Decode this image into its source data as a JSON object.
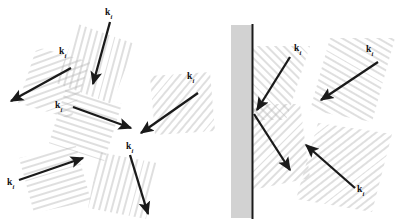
{
  "figure": {
    "background_color": "#ffffff",
    "hatch_color": "#b3b3b3",
    "arrow_color": "#1a1a1a",
    "substrate_fill": "#d2d2d2",
    "substrate_edge": "#1a1a1a",
    "label_symbol": "k",
    "label_subscript": "i"
  },
  "panels": [
    {
      "name": "left-panel",
      "description": "six incident wave-vector arrows with hatched wavefront patches radiating about a center",
      "arrows": [
        {
          "id": "top",
          "label": "k",
          "sub": "i",
          "x1": 110,
          "y1": 22,
          "x2": 93,
          "y2": 84,
          "hatch_angle_deg": 15,
          "label_x": 105,
          "label_y": 8
        },
        {
          "id": "upper-left",
          "label": "k",
          "sub": "i",
          "x1": 71,
          "y1": 68,
          "x2": 11,
          "y2": 101,
          "hatch_angle_deg": 70,
          "label_x": 59,
          "label_y": 47
        },
        {
          "id": "center-right",
          "label": "k",
          "sub": "i",
          "x1": 73,
          "y1": 107,
          "x2": 131,
          "y2": 128,
          "hatch_angle_deg": 108,
          "label_x": 55,
          "label_y": 110
        },
        {
          "id": "right",
          "label": "k",
          "sub": "i",
          "x1": 198,
          "y1": 93,
          "x2": 141,
          "y2": 133,
          "hatch_angle_deg": 40,
          "label_x": 187,
          "label_y": 78
        },
        {
          "id": "lower-left",
          "label": "k",
          "sub": "i",
          "x1": 19,
          "y1": 180,
          "x2": 83,
          "y2": 158,
          "hatch_angle_deg": 73,
          "label_x": 7,
          "label_y": 183
        },
        {
          "id": "lower-right",
          "label": "k",
          "sub": "i",
          "x1": 130,
          "y1": 155,
          "x2": 148,
          "y2": 214,
          "hatch_angle_deg": 15,
          "label_x": 126,
          "label_y": 142
        }
      ]
    },
    {
      "name": "right-panel",
      "description": "reflection geometry at a vertical substrate: incoming and outgoing wave vectors with crossed hatched wavefronts plus two separate incident beams",
      "substrate": {
        "x": 231,
        "y": 25,
        "width": 21,
        "height": 193
      },
      "arrows": [
        {
          "id": "incident-to-surface",
          "label": "k",
          "sub": "i",
          "x1": 290,
          "y1": 57,
          "x2": 254,
          "y2": 113,
          "hatch_angle_deg": 135,
          "label_x": 292,
          "label_y": 44
        },
        {
          "id": "reflected-from-surface",
          "label": "",
          "sub": "",
          "x1": 254,
          "y1": 113,
          "x2": 290,
          "y2": 170,
          "hatch_angle_deg": 45,
          "label_x": 0,
          "label_y": 0
        },
        {
          "id": "incident-upper-right",
          "label": "k",
          "sub": "i",
          "x1": 378,
          "y1": 62,
          "x2": 321,
          "y2": 100,
          "hatch_angle_deg": 120,
          "label_x": 366,
          "label_y": 46
        },
        {
          "id": "incident-lower-right",
          "label": "k",
          "sub": "i",
          "x1": 355,
          "y1": 188,
          "x2": 306,
          "y2": 145,
          "hatch_angle_deg": 52,
          "label_x": 357,
          "label_y": 190
        }
      ]
    }
  ]
}
